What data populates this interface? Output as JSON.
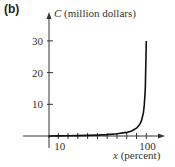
{
  "panel_label": "(b)",
  "chart_data": {
    "type": "line",
    "title": "",
    "xlabel": "x (percent)",
    "ylabel": "C (million dollars)",
    "x_ticks": [
      10,
      20,
      30,
      40,
      50,
      60,
      70,
      80,
      90,
      100
    ],
    "x_tick_labels": [
      "10",
      "100"
    ],
    "y_ticks": [
      10,
      20,
      30
    ],
    "y_tick_labels": [
      "10",
      "20",
      "30"
    ],
    "xlim": [
      0,
      105
    ],
    "ylim": [
      0,
      35
    ],
    "grid": false,
    "series": [
      {
        "name": "C(x)",
        "x": [
          0,
          10,
          20,
          30,
          40,
          50,
          60,
          70,
          80,
          85,
          90,
          93,
          95,
          97,
          98,
          99,
          100
        ],
        "values": [
          0,
          0.03,
          0.07,
          0.13,
          0.2,
          0.29,
          0.44,
          0.68,
          1.14,
          1.59,
          2.45,
          3.49,
          4.75,
          7.28,
          9.8,
          14.85,
          30
        ]
      }
    ]
  }
}
